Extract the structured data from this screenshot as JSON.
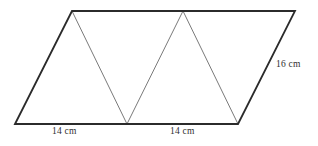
{
  "figure": {
    "type": "geometry-diagram",
    "shape": "parallelogram",
    "background_color": "#ffffff",
    "outline_color": "#2b2b2b",
    "outline_width": 1.8,
    "divider_color": "#7a7a7a",
    "divider_width": 1.0,
    "canvas": {
      "width": 318,
      "height": 146
    },
    "vertices": {
      "bottom_left": {
        "x": 15,
        "y": 124
      },
      "top_left": {
        "x": 72,
        "y": 11
      },
      "top_right": {
        "x": 295,
        "y": 11
      },
      "bottom_right": {
        "x": 238,
        "y": 124
      },
      "bottom_middle": {
        "x": 127,
        "y": 124
      },
      "top_middle": {
        "x": 183,
        "y": 11
      }
    },
    "outline_path": "M 15 124 L 72 11 L 295 11 L 238 124 Z",
    "dividers": [
      {
        "name": "divider-1",
        "from": {
          "x": 72,
          "y": 11
        },
        "to": {
          "x": 127,
          "y": 124
        }
      },
      {
        "name": "divider-2",
        "from": {
          "x": 127,
          "y": 124
        },
        "to": {
          "x": 183,
          "y": 11
        }
      },
      {
        "name": "divider-3",
        "from": {
          "x": 183,
          "y": 11
        },
        "to": {
          "x": 238,
          "y": 124
        }
      }
    ],
    "labels": {
      "base_left": "14 cm",
      "base_right": "14 cm",
      "side_right": "16 cm"
    }
  },
  "chart_data": {
    "type": "diagram",
    "title": "",
    "measurements": [
      {
        "edge": "bottom-left-segment",
        "label": "14 cm",
        "value": 14,
        "unit": "cm"
      },
      {
        "edge": "bottom-right-segment",
        "label": "14 cm",
        "value": 14,
        "unit": "cm"
      },
      {
        "edge": "right-slant-side",
        "label": "16 cm",
        "value": 16,
        "unit": "cm"
      }
    ]
  }
}
